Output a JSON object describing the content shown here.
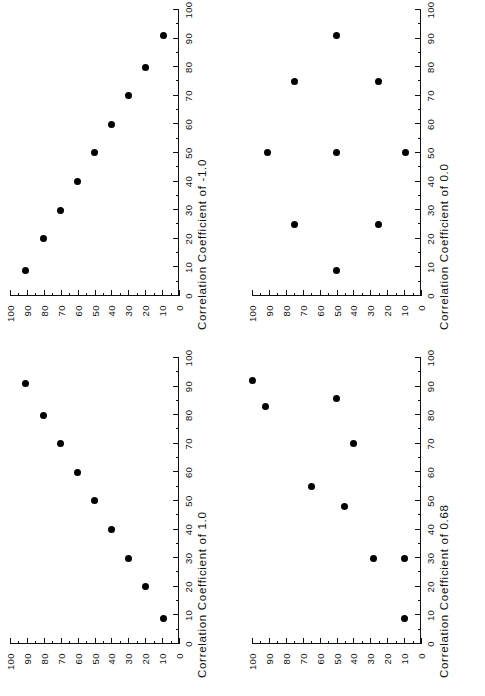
{
  "figure": {
    "layout": "2x2 grid of scatter plots, each panel rotated 90 degrees counter-clockwise",
    "background_color": "#ffffff",
    "marker_color": "#000000",
    "axis_color": "#111111"
  },
  "panels": [
    {
      "id": "panel-correlation-minus-1",
      "position": "top-left",
      "title": "Correlation Coefficient of -1.0"
    },
    {
      "id": "panel-correlation-0",
      "position": "top-right",
      "title": "Correlation Coefficient of  0.0"
    },
    {
      "id": "panel-correlation-1",
      "position": "bottom-left",
      "title": "Correlation Coefficient of  1.0"
    },
    {
      "id": "panel-correlation-068",
      "position": "bottom-right",
      "title": "Correlation Coefficient of  0.68"
    }
  ],
  "axis": {
    "tick_labels": [
      "0",
      "10",
      "20",
      "30",
      "40",
      "50",
      "60",
      "70",
      "80",
      "90",
      "100"
    ],
    "tick_values": [
      0,
      10,
      20,
      30,
      40,
      50,
      60,
      70,
      80,
      90,
      100
    ],
    "minor_tick_step": 5,
    "min": 0,
    "max": 100
  },
  "chart_data": [
    {
      "type": "scatter",
      "title": "Correlation Coefficient of -1.0",
      "xlabel": "",
      "ylabel": "",
      "xlim": [
        0,
        100
      ],
      "ylim": [
        0,
        100
      ],
      "grid": false,
      "legend": "none",
      "correlation": -1.0,
      "x": [
        9,
        20,
        30,
        40,
        50,
        60,
        70,
        80,
        91
      ],
      "y": [
        91,
        80,
        70,
        60,
        50,
        40,
        30,
        20,
        9
      ]
    },
    {
      "type": "scatter",
      "title": "Correlation Coefficient of  0.0",
      "xlabel": "",
      "ylabel": "",
      "xlim": [
        0,
        100
      ],
      "ylim": [
        0,
        100
      ],
      "grid": false,
      "legend": "none",
      "correlation": 0.0,
      "x": [
        50,
        25,
        75,
        9,
        50,
        91,
        25,
        75,
        50
      ],
      "y": [
        9,
        25,
        25,
        50,
        50,
        50,
        75,
        75,
        91
      ]
    },
    {
      "type": "scatter",
      "title": "Correlation Coefficient of  1.0",
      "xlabel": "",
      "ylabel": "",
      "xlim": [
        0,
        100
      ],
      "ylim": [
        0,
        100
      ],
      "grid": false,
      "legend": "none",
      "correlation": 1.0,
      "x": [
        9,
        20,
        30,
        40,
        50,
        60,
        70,
        80,
        91
      ],
      "y": [
        9,
        20,
        30,
        40,
        50,
        60,
        70,
        80,
        91
      ]
    },
    {
      "type": "scatter",
      "title": "Correlation Coefficient of  0.68",
      "xlabel": "",
      "ylabel": "",
      "xlim": [
        0,
        100
      ],
      "ylim": [
        0,
        100
      ],
      "grid": false,
      "legend": "none",
      "correlation": 0.68,
      "x": [
        9,
        30,
        30,
        48,
        55,
        70,
        83,
        86,
        92
      ],
      "y": [
        10,
        10,
        28,
        45,
        65,
        40,
        92,
        50,
        100
      ]
    }
  ]
}
